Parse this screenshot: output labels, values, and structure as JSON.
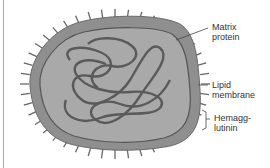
{
  "diagram": {
    "labels": [
      {
        "id": "matrix",
        "lines": [
          "Matrix",
          "protein"
        ]
      },
      {
        "id": "lipid",
        "lines": [
          "Lipid",
          "membrane"
        ]
      },
      {
        "id": "hemag",
        "lines": [
          "Hemagg-",
          "lutinin"
        ]
      }
    ],
    "colors": {
      "envelope": "#8f8f8f",
      "envelope_edge": "#6a6a6a",
      "interior": "#a9a9a9",
      "matrix_line": "#555555",
      "genome": "#5a5a5a",
      "spikes": "#666666",
      "text": "#333333"
    }
  }
}
